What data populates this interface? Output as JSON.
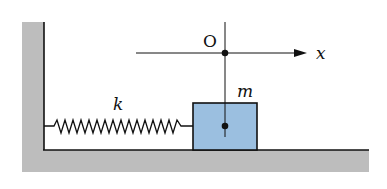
{
  "diagram": {
    "type": "spring-mass system",
    "labels": {
      "origin": "O",
      "axis": "x",
      "spring_constant": "k",
      "mass": "m"
    },
    "colors": {
      "wall_ground": "#bdbdbd",
      "block": "#9bbfe0",
      "line": "#111111",
      "background": "#ffffff"
    }
  }
}
